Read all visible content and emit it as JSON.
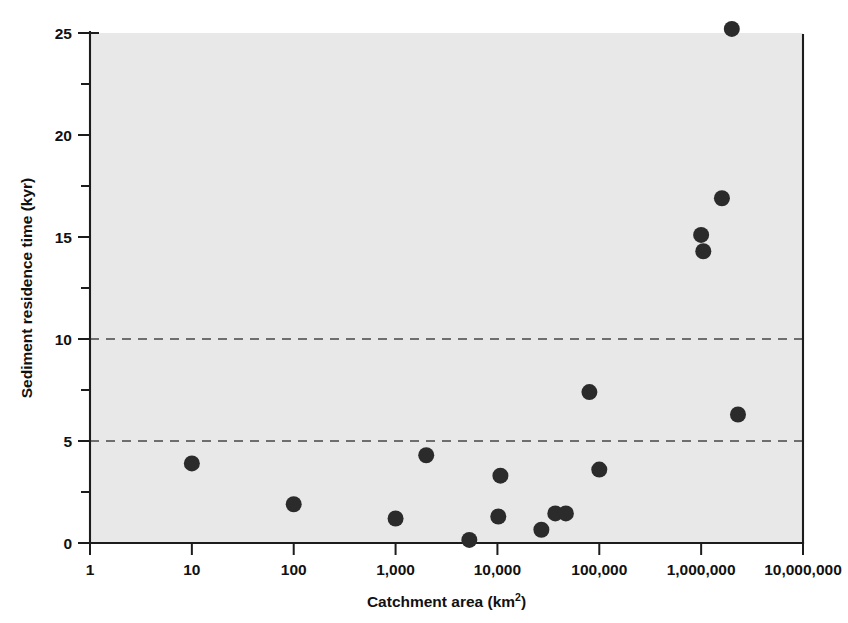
{
  "figure": {
    "background_color": "#ffffff",
    "plot_area_color": "#e8e8e8",
    "marker_color": "#2b2b2b",
    "axis_color": "#1c1c1c",
    "reference_line_color": "#6e6e6e"
  },
  "chart_data": {
    "type": "scatter",
    "title": "",
    "xlabel": "Catchment area (km",
    "xlabel_superscript": "2",
    "xlabel_suffix": ")",
    "ylabel": "Sediment residence time (kyr)",
    "xscale": "log",
    "yscale": "linear",
    "xlim": [
      1,
      10000000
    ],
    "ylim": [
      0,
      25
    ],
    "grid": false,
    "legend": "none",
    "xticklabels": [
      "1",
      "10",
      "100",
      "1,000",
      "10,000",
      "100,000",
      "1,000,000",
      "10,000,000"
    ],
    "xtickvalues": [
      1,
      10,
      100,
      1000,
      10000,
      100000,
      1000000,
      10000000
    ],
    "yticklabels": [
      "0",
      "5",
      "10",
      "15",
      "20",
      "25"
    ],
    "ytickvalues": [
      0,
      5,
      10,
      15,
      20,
      25
    ],
    "yminorticks": [
      2.5,
      7.5,
      12.5,
      17.5,
      22.5
    ],
    "reference_lines": [
      {
        "axis": "y",
        "value": 5,
        "style": "dashed"
      },
      {
        "axis": "y",
        "value": 10,
        "style": "dashed"
      }
    ],
    "points": [
      {
        "x": 10,
        "y": 3.9
      },
      {
        "x": 100,
        "y": 1.9
      },
      {
        "x": 1000,
        "y": 1.2
      },
      {
        "x": 2000,
        "y": 4.3
      },
      {
        "x": 5300,
        "y": 0.15
      },
      {
        "x": 10200,
        "y": 1.3
      },
      {
        "x": 10700,
        "y": 3.3
      },
      {
        "x": 27000,
        "y": 0.65
      },
      {
        "x": 37000,
        "y": 1.45
      },
      {
        "x": 47000,
        "y": 1.45
      },
      {
        "x": 80000,
        "y": 7.4
      },
      {
        "x": 100000,
        "y": 3.6
      },
      {
        "x": 1000000,
        "y": 15.1
      },
      {
        "x": 1050000,
        "y": 14.3
      },
      {
        "x": 1600000,
        "y": 16.9
      },
      {
        "x": 2000000,
        "y": 25.2
      },
      {
        "x": 2300000,
        "y": 6.3
      }
    ],
    "marker_radius_px": 8
  }
}
